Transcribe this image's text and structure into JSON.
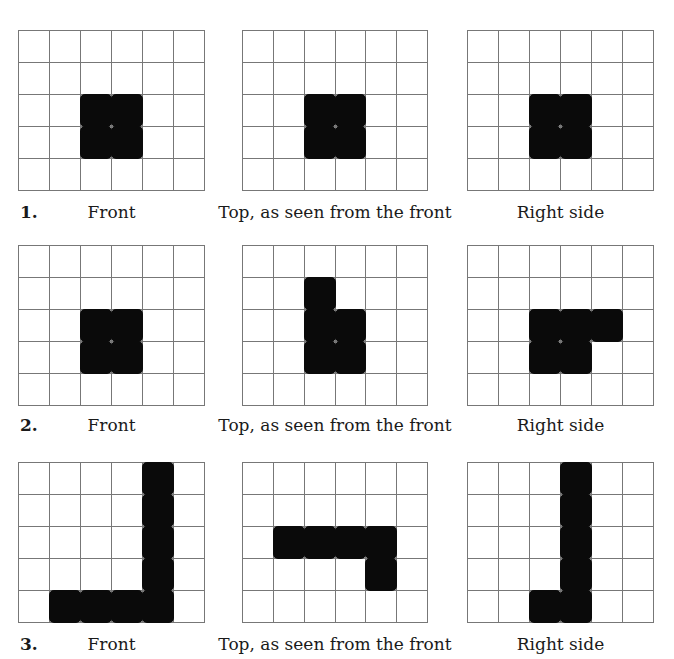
{
  "grid": {
    "rows": 5,
    "cols": 6
  },
  "problems": [
    {
      "number": "1.",
      "views": [
        {
          "label": "Front",
          "filled": [
            [
              2,
              2
            ],
            [
              2,
              3
            ],
            [
              3,
              2
            ],
            [
              3,
              3
            ]
          ]
        },
        {
          "label": "Top, as seen from the front",
          "filled": [
            [
              2,
              2
            ],
            [
              2,
              3
            ],
            [
              3,
              2
            ],
            [
              3,
              3
            ]
          ]
        },
        {
          "label": "Right side",
          "filled": [
            [
              2,
              2
            ],
            [
              2,
              3
            ],
            [
              3,
              2
            ],
            [
              3,
              3
            ]
          ]
        }
      ]
    },
    {
      "number": "2.",
      "views": [
        {
          "label": "Front",
          "filled": [
            [
              2,
              2
            ],
            [
              2,
              3
            ],
            [
              3,
              2
            ],
            [
              3,
              3
            ]
          ]
        },
        {
          "label": "Top, as seen from the front",
          "filled": [
            [
              1,
              2
            ],
            [
              2,
              2
            ],
            [
              2,
              3
            ],
            [
              3,
              2
            ],
            [
              3,
              3
            ]
          ]
        },
        {
          "label": "Right side",
          "filled": [
            [
              2,
              2
            ],
            [
              2,
              3
            ],
            [
              2,
              4
            ],
            [
              3,
              2
            ],
            [
              3,
              3
            ]
          ]
        }
      ]
    },
    {
      "number": "3.",
      "views": [
        {
          "label": "Front",
          "filled": [
            [
              0,
              4
            ],
            [
              1,
              4
            ],
            [
              2,
              4
            ],
            [
              3,
              4
            ],
            [
              4,
              1
            ],
            [
              4,
              2
            ],
            [
              4,
              3
            ],
            [
              4,
              4
            ]
          ]
        },
        {
          "label": "Top, as seen from the front",
          "filled": [
            [
              2,
              1
            ],
            [
              2,
              2
            ],
            [
              2,
              3
            ],
            [
              2,
              4
            ],
            [
              3,
              4
            ]
          ]
        },
        {
          "label": "Right side",
          "filled": [
            [
              0,
              3
            ],
            [
              1,
              3
            ],
            [
              2,
              3
            ],
            [
              3,
              3
            ],
            [
              4,
              2
            ],
            [
              4,
              3
            ]
          ]
        }
      ]
    }
  ]
}
